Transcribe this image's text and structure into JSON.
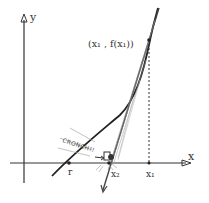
{
  "diagram": {
    "type": "newton-method-sketch",
    "axes": {
      "x_label": "x",
      "y_label": "y"
    },
    "labels": {
      "point": "(x₁ , f(x₁))",
      "root": "r",
      "x1": "x₁",
      "x2": "x₂",
      "sound_effect": "CRONCH!!"
    },
    "colors": {
      "ink": "#333333",
      "background": "#ffffff"
    }
  }
}
